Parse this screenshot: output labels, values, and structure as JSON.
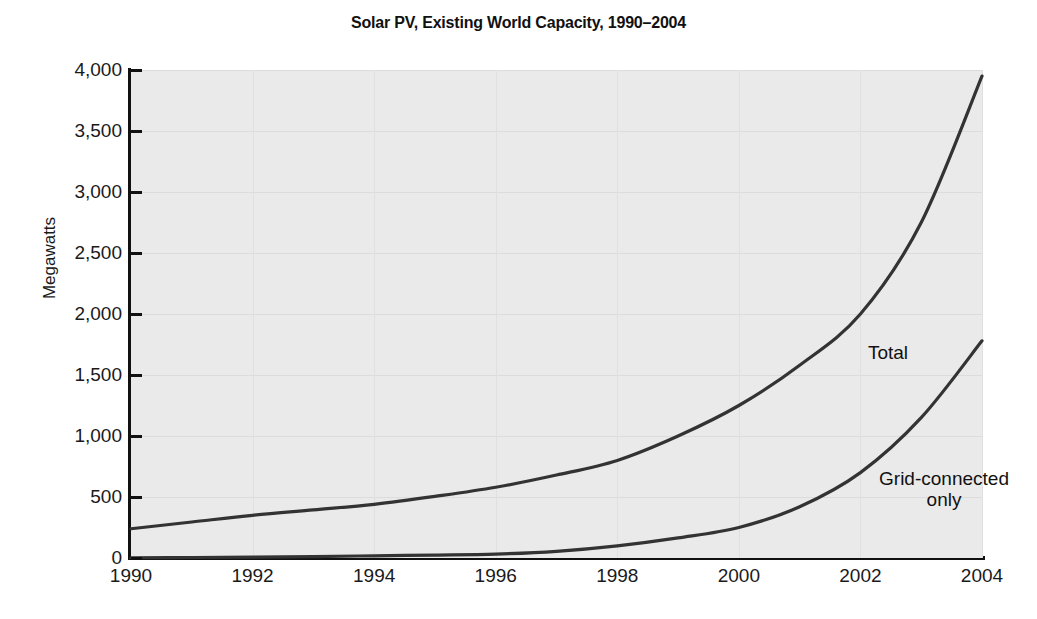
{
  "chart_data": {
    "type": "line",
    "title": "Solar PV, Existing World Capacity, 1990–2004",
    "xlabel": "",
    "ylabel": "Megawatts",
    "x": [
      1990,
      1991,
      1992,
      1993,
      1994,
      1995,
      1996,
      1997,
      1998,
      1999,
      2000,
      2001,
      2002,
      2003,
      2004
    ],
    "xlim": [
      1990,
      2004
    ],
    "ylim": [
      0,
      4000
    ],
    "xticks": [
      "1990",
      "1992",
      "1994",
      "1996",
      "1998",
      "2000",
      "2002",
      "2004"
    ],
    "xtick_values": [
      1990,
      1992,
      1994,
      1996,
      1998,
      2000,
      2002,
      2004
    ],
    "yticks": [
      "0",
      "500",
      "1,000",
      "1,500",
      "2,000",
      "2,500",
      "3,000",
      "3,500",
      "4,000"
    ],
    "ytick_values": [
      0,
      500,
      1000,
      1500,
      2000,
      2500,
      3000,
      3500,
      4000
    ],
    "grid": true,
    "legend_position": "inline-annotations",
    "series": [
      {
        "name": "Total",
        "label": "Total",
        "color": "#333333",
        "values": [
          240,
          295,
          350,
          395,
          440,
          505,
          580,
          680,
          800,
          1000,
          1250,
          1580,
          2000,
          2750,
          3950
        ]
      },
      {
        "name": "Grid-connected only",
        "label": "Grid-connected\nonly",
        "color": "#333333",
        "values": [
          2,
          4,
          7,
          12,
          18,
          24,
          32,
          55,
          100,
          165,
          250,
          420,
          700,
          1150,
          1780
        ]
      }
    ],
    "annotations": [
      {
        "text": "Total",
        "x": 2001,
        "y": 2200
      },
      {
        "text": "Grid-connected\nonly",
        "x": 2001,
        "y": 1100
      }
    ],
    "colors": {
      "plot_background": "#eaeaea",
      "page_background": "#ffffff",
      "axis": "#111111",
      "gridline": "#dcdcdc",
      "line": "#333333",
      "text": "#1a1a1a"
    }
  }
}
